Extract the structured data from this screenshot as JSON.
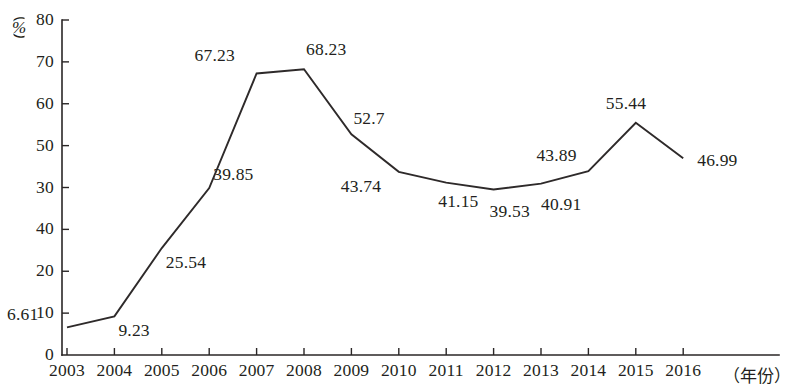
{
  "chart_data": {
    "type": "line",
    "title": "",
    "xlabel": "（年份）",
    "ylabel": "（%）",
    "ylim": [
      0,
      80
    ],
    "grid": false,
    "legend": "none",
    "ytick_labels": [
      "80",
      "70",
      "60",
      "50",
      "30",
      "40",
      "20",
      "10",
      "0"
    ],
    "ytick_values": [
      80,
      70,
      60,
      50,
      40,
      30,
      20,
      10,
      0
    ],
    "categories": [
      "2003",
      "2004",
      "2005",
      "2006",
      "2007",
      "2008",
      "2009",
      "2010",
      "2011",
      "2012",
      "2013",
      "2014",
      "2015",
      "2016"
    ],
    "values": [
      6.61,
      9.23,
      25.54,
      39.85,
      67.23,
      68.23,
      52.7,
      43.74,
      41.15,
      39.53,
      40.91,
      43.89,
      55.44,
      46.99
    ],
    "value_labels": [
      "6.61",
      "9.23",
      "25.54",
      "39.85",
      "67.23",
      "68.23",
      "52.7",
      "43.74",
      "41.15",
      "39.53",
      "40.91",
      "43.89",
      "55.44",
      "46.99"
    ],
    "series": [
      {
        "name": "",
        "values": [
          6.61,
          9.23,
          25.54,
          39.85,
          67.23,
          68.23,
          52.7,
          43.74,
          41.15,
          39.53,
          40.91,
          43.89,
          55.44,
          46.99
        ]
      }
    ],
    "line_color": "#2e2a2a",
    "axis_color": "#2a2626",
    "background_color": "#ffffff"
  }
}
